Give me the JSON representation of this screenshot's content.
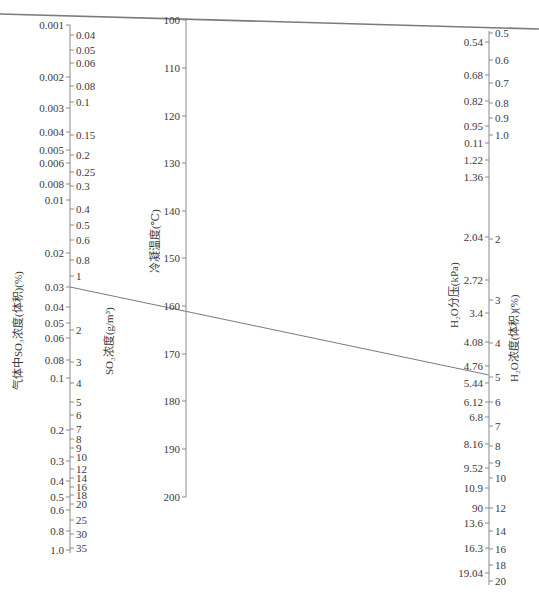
{
  "chart_data": {
    "type": "nomogram",
    "title": "",
    "axes": [
      {
        "id": "so3_volume",
        "title": "气体中SO₃浓度(体积)(%)",
        "side": "left-outer",
        "scale": "log",
        "ticks": [
          {
            "label": "0.001",
            "y": 25
          },
          {
            "label": "0.002",
            "y": 77
          },
          {
            "label": "0.003",
            "y": 108
          },
          {
            "label": "0.004",
            "y": 132
          },
          {
            "label": "0.005",
            "y": 150
          },
          {
            "label": "0.006",
            "y": 163
          },
          {
            "label": "0.008",
            "y": 184
          },
          {
            "label": "0.01",
            "y": 200
          },
          {
            "label": "0.02",
            "y": 253
          },
          {
            "label": "0.03",
            "y": 287
          },
          {
            "label": "0.04",
            "y": 307
          },
          {
            "label": "0.05",
            "y": 323
          },
          {
            "label": "0.06",
            "y": 338
          },
          {
            "label": "0.08",
            "y": 360
          },
          {
            "label": "0.1",
            "y": 378
          },
          {
            "label": "0.2",
            "y": 430
          },
          {
            "label": "0.3",
            "y": 461
          },
          {
            "label": "0.4",
            "y": 481
          },
          {
            "label": "0.5",
            "y": 497
          },
          {
            "label": "0.6",
            "y": 510
          },
          {
            "label": "0.8",
            "y": 531
          },
          {
            "label": "1.0",
            "y": 550
          }
        ]
      },
      {
        "id": "so3_mass",
        "title": "SO₃浓度(g/m³)",
        "side": "left-inner",
        "scale": "log",
        "ticks": [
          {
            "label": "0.04",
            "y": 35
          },
          {
            "label": "0.05",
            "y": 50
          },
          {
            "label": "0.06",
            "y": 63
          },
          {
            "label": "0.08",
            "y": 86
          },
          {
            "label": "0.1",
            "y": 102
          },
          {
            "label": "0.15",
            "y": 135
          },
          {
            "label": "0.2",
            "y": 155
          },
          {
            "label": "0.25",
            "y": 172
          },
          {
            "label": "0.3",
            "y": 186
          },
          {
            "label": "0.4",
            "y": 209
          },
          {
            "label": "0.5",
            "y": 225
          },
          {
            "label": "0.6",
            "y": 240
          },
          {
            "label": "0.8",
            "y": 260
          },
          {
            "label": "1",
            "y": 276
          },
          {
            "label": "2",
            "y": 330
          },
          {
            "label": "3",
            "y": 362
          },
          {
            "label": "4",
            "y": 383
          },
          {
            "label": "5",
            "y": 402
          },
          {
            "label": "6",
            "y": 415
          },
          {
            "label": "7",
            "y": 429
          },
          {
            "label": "8",
            "y": 439
          },
          {
            "label": "9",
            "y": 448
          },
          {
            "label": "10",
            "y": 457
          },
          {
            "label": "12",
            "y": 469
          },
          {
            "label": "14",
            "y": 478
          },
          {
            "label": "16",
            "y": 487
          },
          {
            "label": "18",
            "y": 495
          },
          {
            "label": "20",
            "y": 504
          },
          {
            "label": "25",
            "y": 520
          },
          {
            "label": "30",
            "y": 534
          },
          {
            "label": "35",
            "y": 548
          }
        ]
      },
      {
        "id": "condensation_temp",
        "title": "冷凝温度(℃)",
        "side": "middle",
        "scale": "linear",
        "range": [
          100,
          200
        ],
        "ticks": [
          {
            "label": "100",
            "y": 20
          },
          {
            "label": "110",
            "y": 68
          },
          {
            "label": "120",
            "y": 116
          },
          {
            "label": "130",
            "y": 163
          },
          {
            "label": "140",
            "y": 211
          },
          {
            "label": "150",
            "y": 258
          },
          {
            "label": "160",
            "y": 306
          },
          {
            "label": "170",
            "y": 354
          },
          {
            "label": "180",
            "y": 401
          },
          {
            "label": "190",
            "y": 449
          },
          {
            "label": "200",
            "y": 497
          }
        ]
      },
      {
        "id": "h2o_pressure",
        "title": "H₂O分压(kPa)",
        "side": "right-outer",
        "scale": "log",
        "ticks": [
          {
            "label": "0.54",
            "y": 42
          },
          {
            "label": "0.68",
            "y": 75
          },
          {
            "label": "0.82",
            "y": 101
          },
          {
            "label": "0.95",
            "y": 126
          },
          {
            "label": "0.11",
            "y": 143
          },
          {
            "label": "1.22",
            "y": 160
          },
          {
            "label": "1.36",
            "y": 177
          },
          {
            "label": "2.04",
            "y": 237
          },
          {
            "label": "2.72",
            "y": 280
          },
          {
            "label": "3.4",
            "y": 313
          },
          {
            "label": "4.08",
            "y": 342
          },
          {
            "label": "4.76",
            "y": 366
          },
          {
            "label": "5.44",
            "y": 383
          },
          {
            "label": "6.12",
            "y": 402
          },
          {
            "label": "6.8",
            "y": 417
          },
          {
            "label": "8.16",
            "y": 444
          },
          {
            "label": "9.52",
            "y": 468
          },
          {
            "label": "10.9",
            "y": 488
          },
          {
            "label": "90",
            "y": 508
          },
          {
            "label": "13.6",
            "y": 523
          },
          {
            "label": "16.3",
            "y": 548
          },
          {
            "label": "19.04",
            "y": 573
          }
        ]
      },
      {
        "id": "h2o_volume",
        "title": "H₂O浓度(体积)(%)",
        "side": "right-inner",
        "scale": "log",
        "ticks": [
          {
            "label": "0.5",
            "y": 33
          },
          {
            "label": "0.6",
            "y": 60
          },
          {
            "label": "0.7",
            "y": 83
          },
          {
            "label": "0.8",
            "y": 103
          },
          {
            "label": "0.9",
            "y": 118
          },
          {
            "label": "1.0",
            "y": 135
          },
          {
            "label": "2",
            "y": 239
          },
          {
            "label": "3",
            "y": 300
          },
          {
            "label": "4",
            "y": 343
          },
          {
            "label": "5",
            "y": 377
          },
          {
            "label": "6",
            "y": 402
          },
          {
            "label": "7",
            "y": 426
          },
          {
            "label": "8",
            "y": 446
          },
          {
            "label": "9",
            "y": 463
          },
          {
            "label": "10",
            "y": 478
          },
          {
            "label": "12",
            "y": 508
          },
          {
            "label": "14",
            "y": 531
          },
          {
            "label": "16",
            "y": 549
          },
          {
            "label": "18",
            "y": 565
          },
          {
            "label": "20",
            "y": 581
          }
        ]
      }
    ],
    "isopleths": [
      {
        "name": "top-line",
        "from": {
          "x": 0,
          "y": 14
        },
        "to": {
          "x": 539,
          "y": 29
        },
        "passes": {
          "condensation_temp": "100"
        }
      },
      {
        "name": "example-line",
        "from": {
          "x": 70,
          "y": 287
        },
        "to": {
          "x": 489,
          "y": 375
        },
        "passes": {
          "so3_volume": "0.03",
          "condensation_temp": "≈161",
          "h2o_volume": "5"
        }
      }
    ],
    "colors": {
      "axis": "#8a8a8a",
      "line": "#7a7a7a",
      "text": "#3a3a3a"
    }
  },
  "labels": {
    "so3_volume_title": "气体中SO₃浓度(体积)(%)",
    "so3_mass_title": "SO₃浓度(g/m³)",
    "temp_title": "冷凝温度(℃)",
    "h2o_pressure_title": "H₂O分压(kPa)",
    "h2o_volume_title": "H₂O浓度(体积)(%)"
  }
}
